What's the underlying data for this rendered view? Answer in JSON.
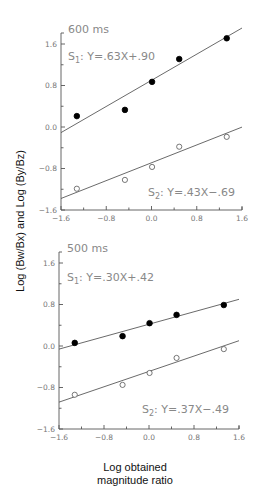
{
  "figure": {
    "ylabel": "Log (Bw/Bx) and Log (By/Bz)",
    "xlabel_line1": "Log obtained",
    "xlabel_line2": "magnitude ratio"
  },
  "chart_data": [
    {
      "type": "scatter",
      "title": "600 ms",
      "xlabel": "Log obtained magnitude ratio",
      "ylabel": "Log (Bw/Bx) and Log (By/Bz)",
      "xlim": [
        -1.6,
        1.6
      ],
      "ylim": [
        -1.6,
        1.6
      ],
      "xticks": [
        "-1.6",
        "-0.8",
        "0.0",
        "0.8",
        "1.6"
      ],
      "yticks": [
        "1.6",
        "0.8",
        "0.0",
        "-0.8",
        "-1.6"
      ],
      "grid": false,
      "series": [
        {
          "name": "S1",
          "marker": "filled-circle",
          "equation": "Y=.63X+.90",
          "slope": 0.63,
          "intercept": 0.9,
          "x": [
            -1.32,
            -0.47,
            0.01,
            0.49,
            1.33
          ],
          "y": [
            0.21,
            0.33,
            0.87,
            1.31,
            1.71
          ]
        },
        {
          "name": "S2",
          "marker": "open-circle",
          "equation": "Y=.43X-.69",
          "slope": 0.43,
          "intercept": -0.69,
          "x": [
            -1.32,
            -0.47,
            0.01,
            0.49,
            1.33
          ],
          "y": [
            -1.19,
            -1.02,
            -0.77,
            -0.38,
            -0.19
          ]
        }
      ]
    },
    {
      "type": "scatter",
      "title": "500 ms",
      "xlabel": "Log obtained magnitude ratio",
      "ylabel": "Log (Bw/Bx) and Log (By/Bz)",
      "xlim": [
        -1.6,
        1.6
      ],
      "ylim": [
        -1.6,
        1.6
      ],
      "xticks": [
        "-1.6",
        "-0.8",
        "0.0",
        "0.8",
        "1.6"
      ],
      "yticks": [
        "1.6",
        "0.8",
        "0.0",
        "-0.8",
        "-1.6"
      ],
      "grid": false,
      "series": [
        {
          "name": "S1",
          "marker": "filled-circle",
          "equation": "Y=.30X+.42",
          "slope": 0.3,
          "intercept": 0.42,
          "x": [
            -1.32,
            -0.47,
            0.01,
            0.49,
            1.33
          ],
          "y": [
            0.06,
            0.19,
            0.44,
            0.6,
            0.79
          ]
        },
        {
          "name": "S2",
          "marker": "open-circle",
          "equation": "Y=.37X-.49",
          "slope": 0.37,
          "intercept": -0.49,
          "x": [
            -1.32,
            -0.47,
            0.01,
            0.49,
            1.33
          ],
          "y": [
            -0.94,
            -0.75,
            -0.52,
            -0.23,
            -0.06
          ]
        }
      ]
    }
  ],
  "panels": [
    {
      "title": "600 ms",
      "s1_label": "S",
      "s1_sub": "1",
      "s1_eq": ": Y=.63X+.90",
      "s2_label": "S",
      "s2_sub": "2",
      "s2_eq": ": Y=.43X−.69"
    },
    {
      "title": "500 ms",
      "s1_label": "S",
      "s1_sub": "1",
      "s1_eq": ": Y=.30X+.42",
      "s2_label": "S",
      "s2_sub": "2",
      "s2_eq": ": Y=.37X−.49"
    }
  ],
  "ticks": {
    "y": [
      "1.6",
      "0.8",
      "0.0",
      "-0.8",
      "-1.6"
    ],
    "x": [
      "−1.6",
      "−0.8",
      "0.0",
      "0.8",
      "1.6"
    ]
  }
}
